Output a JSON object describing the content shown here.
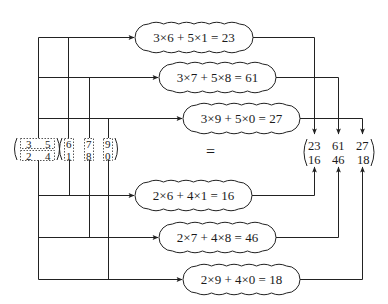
{
  "diagram": {
    "left_matrix": {
      "rows": [
        [
          "3",
          "5"
        ],
        [
          "2",
          "4"
        ]
      ]
    },
    "right_matrix": {
      "rows": [
        [
          "6",
          "7",
          "9"
        ],
        [
          "1",
          "8",
          "0"
        ]
      ]
    },
    "equals": "=",
    "result_matrix": {
      "rows": [
        [
          "23",
          "61",
          "27"
        ],
        [
          "16",
          "46",
          "18"
        ]
      ]
    },
    "bubbles": [
      {
        "id": "r1c1",
        "label": "3×6 + 5×1 = 23"
      },
      {
        "id": "r1c2",
        "label": "3×7 + 5×8 = 61"
      },
      {
        "id": "r1c3",
        "label": "3×9 + 5×0 = 27"
      },
      {
        "id": "r2c1",
        "label": "2×6 + 4×1 = 16"
      },
      {
        "id": "r2c2",
        "label": "2×7 + 4×8 = 46"
      },
      {
        "id": "r2c3",
        "label": "2×9 + 4×0 = 18"
      }
    ],
    "colors": {
      "line": "#222222",
      "dashed": "#555555",
      "text": "#1a1a1a"
    }
  }
}
